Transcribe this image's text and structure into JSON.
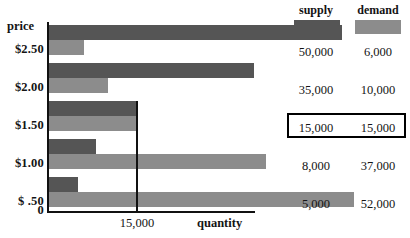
{
  "chart_data": {
    "type": "bar",
    "orientation": "horizontal",
    "title": "",
    "xlabel": "quantity",
    "ylabel": "price",
    "categories": [
      "$2.50",
      "$2.00",
      "$1.50",
      "$1.00",
      "$ .50"
    ],
    "series": [
      {
        "name": "supply",
        "color": "#555555",
        "values": [
          50000,
          35000,
          15000,
          8000,
          5000
        ]
      },
      {
        "name": "demand",
        "color": "#8c8c8c",
        "values": [
          6000,
          10000,
          15000,
          37000,
          52000
        ]
      }
    ],
    "xlim": [
      0,
      57000
    ],
    "xticks": [
      "0",
      "15,000"
    ],
    "grid": false,
    "legend": "right",
    "annotations": [
      {
        "kind": "vertical-reference-line",
        "x": 15000,
        "label": "15,000"
      },
      {
        "kind": "highlight-box",
        "row": "$1.50",
        "note": "equilibrium row boxed"
      }
    ],
    "y_origin_label": "0"
  },
  "axes": {
    "y_title": "price",
    "x_title": "quantity",
    "y_ticks": [
      "$2.50",
      "$2.00",
      "$1.50",
      "$1.00",
      "$ .50"
    ],
    "origin": "0",
    "x_tick_15000": "15,000"
  },
  "table": {
    "headers": [
      "supply",
      "demand"
    ],
    "swatch_colors": [
      "#555555",
      "#8c8c8c"
    ],
    "rows": [
      {
        "supply": "50,000",
        "demand": "6,000",
        "boxed": false
      },
      {
        "supply": "35,000",
        "demand": "10,000",
        "boxed": false
      },
      {
        "supply": "15,000",
        "demand": "15,000",
        "boxed": true
      },
      {
        "supply": "8,000",
        "demand": "37,000",
        "boxed": false
      },
      {
        "supply": "5,000",
        "demand": "52,000",
        "boxed": false
      }
    ]
  }
}
